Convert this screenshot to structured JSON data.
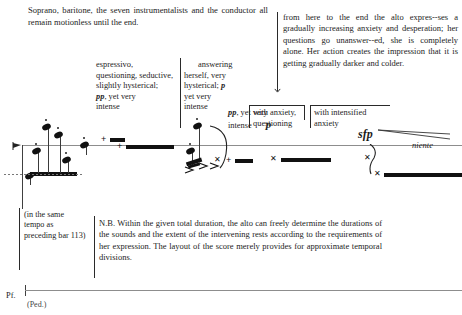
{
  "document": {
    "type": "musical-score-page",
    "header_note": "Soprano, baritone, the seven instrumentalists and the conductor all remain motionless until the end.",
    "alto_note": "from here to the end the alto expres--ses a gradually increasing anxiety and desperation; her questions go unanswer--ed, she is completely alone. Her action creates the impression that it is getting gradually darker and colder.",
    "nb_note": "N.B. Within the given total duration, the alto can freely determine the durations of the sounds and the extent of the intervening rests according to the requirements of her expression. The layout of the score merely provides for approximate temporal divisions.",
    "tempo_note": "(in the same tempo as preceding bar 113)"
  },
  "annotations": [
    {
      "id": "annot-1",
      "line1": "espressivo,",
      "line2": "questioning, seductive,",
      "line3": "slightly hysterical;",
      "dynamic": "pp",
      "line4": ", yet very",
      "line5": "intense"
    },
    {
      "id": "annot-2",
      "line1": "answering",
      "line2": "herself, very",
      "line3": "hysterical;",
      "dynamic": "p",
      "line4": "yet very",
      "line5": "intense"
    },
    {
      "id": "annot-3",
      "line1": "with anxiety,",
      "line2": "questioning"
    },
    {
      "id": "annot-4",
      "line1": "with intensified",
      "line2": "anxiety"
    }
  ],
  "dynamics": {
    "pp": "pp",
    "p_first": "p",
    "pp_mid": "pp",
    "pp_mid_tail": ", yet very",
    "pp_mid_tail2": "intense",
    "p_solo": "p",
    "sfp": "sfp",
    "niente": "niente"
  },
  "staff": {
    "instrument_label": "Pf.",
    "pedal_mark": "(Ped.)"
  },
  "colors": {
    "ink": "#232323",
    "stave": "#8d8d8d",
    "note": "#111111"
  }
}
